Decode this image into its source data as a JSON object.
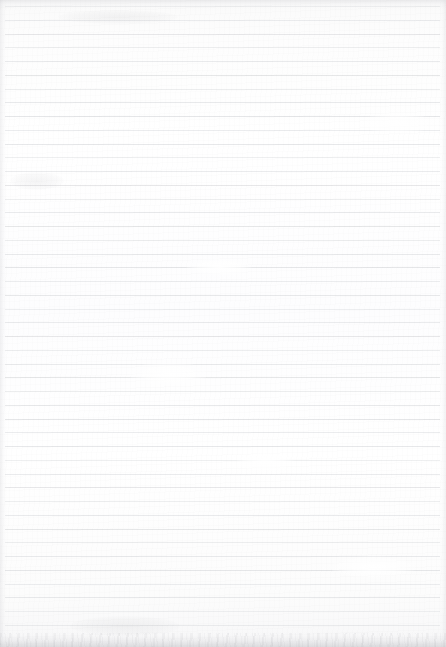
{
  "document": {
    "kind": "scanned-lined-paper",
    "title": "Blank ruled notebook page",
    "text_content": "",
    "handwriting": "",
    "page_width": 446,
    "page_height": 647,
    "paper_color": "#fdfdfd",
    "rule_color": "#e4e5e7",
    "edge_shadow_color": "#b2b2b7"
  },
  "ruling": {
    "style": "horizontal-ruled",
    "line_count": 46,
    "first_line_y": 6,
    "line_spacing": 13.75,
    "line_thickness": 1,
    "left_inset": 5,
    "right_inset": 6,
    "margin_rule": "none",
    "bottom_margin_height": 13
  },
  "marks": [
    {
      "name": "smudge-upper-right",
      "x": 362,
      "y": 112,
      "w": 70,
      "h": 22,
      "tone": "light"
    },
    {
      "name": "smudge-mid-left",
      "x": 128,
      "y": 362,
      "w": 80,
      "h": 24,
      "tone": "light"
    },
    {
      "name": "smudge-upper-mid",
      "x": 186,
      "y": 258,
      "w": 66,
      "h": 18,
      "tone": "light"
    },
    {
      "name": "smudge-lower-mid",
      "x": 236,
      "y": 452,
      "w": 58,
      "h": 20,
      "tone": "light"
    },
    {
      "name": "smudge-top-band",
      "x": 58,
      "y": 10,
      "w": 120,
      "h": 14,
      "tone": "dark"
    },
    {
      "name": "smudge-right-low",
      "x": 330,
      "y": 556,
      "w": 86,
      "h": 22,
      "tone": "light"
    },
    {
      "name": "smudge-left-high",
      "x": 10,
      "y": 172,
      "w": 54,
      "h": 18,
      "tone": "dark"
    },
    {
      "name": "smudge-bottom-left",
      "x": 70,
      "y": 616,
      "w": 110,
      "h": 20,
      "tone": "dark"
    }
  ]
}
